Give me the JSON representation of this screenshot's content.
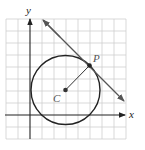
{
  "figure": {
    "axes": {
      "x_label": "x",
      "y_label": "y"
    },
    "grid": {
      "cols": 10,
      "rows": 10,
      "unit_px": 12
    },
    "points": {
      "center": {
        "label": "C",
        "x": 3,
        "y": 2
      },
      "tangent_point": {
        "label": "P",
        "x": 5,
        "y": 4
      }
    },
    "circle": {
      "center_label": "C",
      "radius_units": 2.83
    },
    "tangent_line": {
      "through": "P",
      "slope": -1,
      "arrows": "both"
    },
    "colors": {
      "grid": "#cfcfcf",
      "ink": "#222222",
      "tangent": "#555555"
    }
  }
}
